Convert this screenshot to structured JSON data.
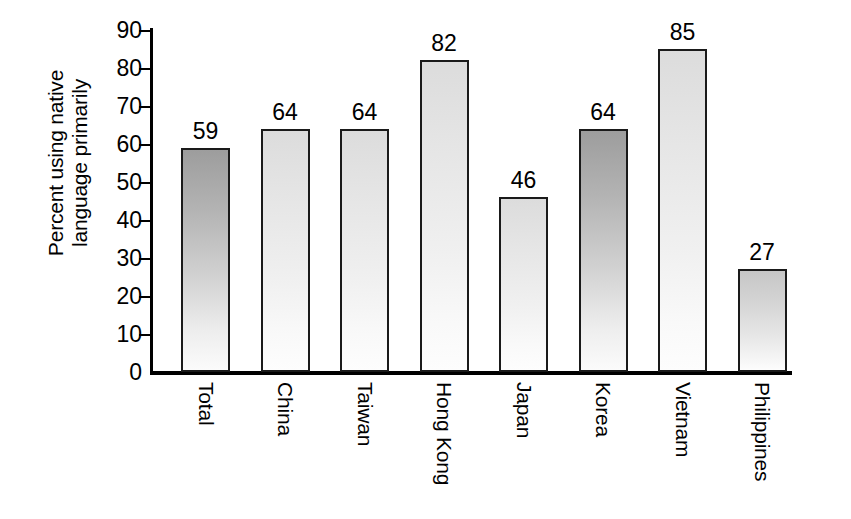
{
  "chart_data": {
    "type": "bar",
    "title": "",
    "subtitle": "",
    "xlabel": "",
    "ylabel": "Percent using native language primarily",
    "ylabel_lines": [
      "Percent using native",
      "language primarily"
    ],
    "categories": [
      "Total",
      "China",
      "Taiwan",
      "Hong Kong",
      "Japan",
      "Korea",
      "Vietnam",
      "Philippines"
    ],
    "values": [
      59,
      64,
      64,
      82,
      46,
      64,
      85,
      27
    ],
    "value_labels": [
      "59",
      "64",
      "64",
      "82",
      "46",
      "64",
      "85",
      "27"
    ],
    "ylim": [
      0,
      90
    ],
    "ytick_values": [
      0,
      10,
      20,
      30,
      40,
      50,
      60,
      70,
      80,
      90
    ],
    "ytick_labels": [
      "0",
      "10",
      "20",
      "30",
      "40",
      "50",
      "60",
      "70",
      "80",
      "90"
    ],
    "grid": false,
    "legend": null,
    "legend_position": "none",
    "bar_tones": [
      "dark",
      "light",
      "light",
      "light",
      "light",
      "dark",
      "light",
      "mid"
    ],
    "annotations": []
  },
  "style": {
    "background": "#ffffff",
    "axis_color": "#000000",
    "text_color": "#000000",
    "bar_outline": "#1a1a1a",
    "bar_fill_dark_top": "#9d9d9d",
    "bar_fill_light_top": "#dcdcdc",
    "bar_fill_mid_top": "#c6c6c6",
    "bar_fill_bottom": "#fdfdfd"
  }
}
